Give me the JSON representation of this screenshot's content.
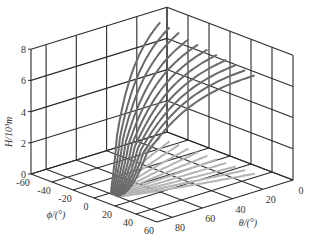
{
  "chart_data": {
    "type": "line3d",
    "title": "",
    "axes": {
      "x": {
        "name": "theta",
        "label": "θ/(°)",
        "ticks": [
          0,
          20,
          40,
          60,
          80
        ],
        "range": [
          0,
          90
        ]
      },
      "y": {
        "name": "phi",
        "label": "ϕ/(°)",
        "ticks": [
          -60,
          -40,
          -20,
          0,
          20,
          40,
          60
        ],
        "range": [
          -60,
          60
        ]
      },
      "z": {
        "name": "H",
        "label": "H/10³m",
        "ticks": [
          0,
          2,
          4,
          6,
          8
        ],
        "range": [
          0,
          8
        ]
      }
    },
    "grid": true,
    "view": "3D box with three back walls gridded; curves projected onto floor (light gray)",
    "series_description": "Family of ~13 trajectory curves, each starting near (θ≈75–85°, ϕ≈0°, H≈0) and rising to H≈6–8 while θ decreases toward 0–10° and ϕ spreads from -60° to +40°; shadows on the floor plane in light gray.",
    "series": [
      {
        "name": "curve-1",
        "phi_end": -55,
        "theta_end": 8,
        "h_end": 7.4
      },
      {
        "name": "curve-2",
        "phi_end": -46,
        "theta_end": 8,
        "h_end": 7.3
      },
      {
        "name": "curve-3",
        "phi_end": -37,
        "theta_end": 8,
        "h_end": 7.2
      },
      {
        "name": "curve-4",
        "phi_end": -28,
        "theta_end": 8,
        "h_end": 7.0
      },
      {
        "name": "curve-5",
        "phi_end": -19,
        "theta_end": 8,
        "h_end": 6.9
      },
      {
        "name": "curve-6",
        "phi_end": -10,
        "theta_end": 8,
        "h_end": 6.8
      },
      {
        "name": "curve-7",
        "phi_end": -1,
        "theta_end": 8,
        "h_end": 6.7
      },
      {
        "name": "curve-8",
        "phi_end": 8,
        "theta_end": 8,
        "h_end": 6.6
      },
      {
        "name": "curve-9",
        "phi_end": 17,
        "theta_end": 8,
        "h_end": 6.5
      },
      {
        "name": "curve-10",
        "phi_end": 26,
        "theta_end": 8,
        "h_end": 6.4
      },
      {
        "name": "curve-11",
        "phi_end": 35,
        "theta_end": 8,
        "h_end": 6.3
      }
    ],
    "colors": {
      "curves": "#6a6a6a",
      "shadows": "#b4b4b4",
      "grid": "#2a2a2a"
    }
  }
}
